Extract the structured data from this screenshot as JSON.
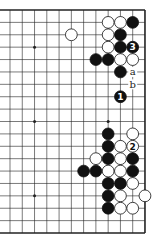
{
  "diagram": {
    "type": "go-board-partial",
    "visible_columns": 12,
    "visible_rows": 19,
    "edges": [
      "top",
      "right",
      "bottom"
    ],
    "grid": {
      "x0": 10,
      "dx": 12.27,
      "y0": 10,
      "dy": 12.39
    },
    "star_points": [
      [
        2,
        3
      ],
      [
        8,
        3
      ],
      [
        2,
        9
      ],
      [
        8,
        9
      ],
      [
        2,
        15
      ],
      [
        8,
        15
      ]
    ],
    "stones": [
      {
        "c": 8,
        "r": 1,
        "color": "white"
      },
      {
        "c": 9,
        "r": 1,
        "color": "white"
      },
      {
        "c": 10,
        "r": 1,
        "color": "black"
      },
      {
        "c": 5,
        "r": 2,
        "color": "white"
      },
      {
        "c": 8,
        "r": 2,
        "color": "white"
      },
      {
        "c": 9,
        "r": 2,
        "color": "black"
      },
      {
        "c": 8,
        "r": 3,
        "color": "white"
      },
      {
        "c": 9,
        "r": 3,
        "color": "black"
      },
      {
        "c": 10,
        "r": 3,
        "color": "black",
        "label": "3"
      },
      {
        "c": 7,
        "r": 4,
        "color": "black"
      },
      {
        "c": 8,
        "r": 4,
        "color": "black"
      },
      {
        "c": 9,
        "r": 4,
        "color": "white"
      },
      {
        "c": 10,
        "r": 4,
        "color": "white"
      },
      {
        "c": 9,
        "r": 5,
        "color": "black"
      },
      {
        "c": 9,
        "r": 7,
        "color": "black",
        "label": "1"
      },
      {
        "c": 8,
        "r": 10,
        "color": "black"
      },
      {
        "c": 10,
        "r": 10,
        "color": "white"
      },
      {
        "c": 8,
        "r": 11,
        "color": "black"
      },
      {
        "c": 9,
        "r": 11,
        "color": "white"
      },
      {
        "c": 10,
        "r": 11,
        "color": "white",
        "label": "2"
      },
      {
        "c": 7,
        "r": 12,
        "color": "white"
      },
      {
        "c": 8,
        "r": 12,
        "color": "black"
      },
      {
        "c": 9,
        "r": 12,
        "color": "white"
      },
      {
        "c": 10,
        "r": 12,
        "color": "black"
      },
      {
        "c": 6,
        "r": 13,
        "color": "black"
      },
      {
        "c": 7,
        "r": 13,
        "color": "black"
      },
      {
        "c": 8,
        "r": 13,
        "color": "white"
      },
      {
        "c": 9,
        "r": 13,
        "color": "white"
      },
      {
        "c": 10,
        "r": 13,
        "color": "black"
      },
      {
        "c": 8,
        "r": 14,
        "color": "black"
      },
      {
        "c": 9,
        "r": 14,
        "color": "black"
      },
      {
        "c": 10,
        "r": 14,
        "color": "white"
      },
      {
        "c": 8,
        "r": 15,
        "color": "black"
      },
      {
        "c": 9,
        "r": 15,
        "color": "white"
      },
      {
        "c": 11,
        "r": 15,
        "color": "white"
      },
      {
        "c": 8,
        "r": 16,
        "color": "black"
      },
      {
        "c": 9,
        "r": 16,
        "color": "white"
      },
      {
        "c": 10,
        "r": 16,
        "color": "white"
      }
    ],
    "letter_marks": [
      {
        "c": 10,
        "r": 5,
        "label": "a"
      },
      {
        "c": 10,
        "r": 6,
        "label": "b"
      }
    ],
    "colors": {
      "line": "#222222",
      "black_stone": "#111111",
      "white_stone": "#ffffff",
      "background": "#ffffff"
    }
  }
}
